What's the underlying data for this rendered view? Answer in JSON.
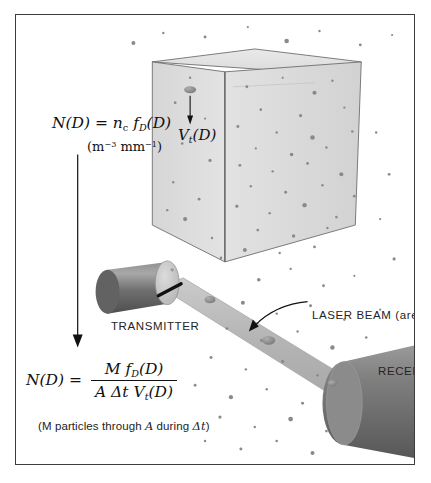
{
  "figure": {
    "border_color": "#3c3c3c",
    "background": "#ffffff"
  },
  "equations": {
    "top": {
      "lhs": "N(D)",
      "equals": "=",
      "rhs_coeff": "n",
      "rhs_coeff_sub": "c",
      "rhs_func": "f",
      "rhs_func_sub": "D",
      "rhs_arg": "(D)",
      "units_open": "(m",
      "units_exp1": "−3",
      "units_mid": " mm",
      "units_exp2": "−1",
      "units_close": ")"
    },
    "bottom": {
      "lhs": "N(D)",
      "equals": "=",
      "numerator_m": "M",
      "numerator_f": "f",
      "numerator_f_sub": "D",
      "numerator_arg": "(D)",
      "denominator_a": "A",
      "denominator_dt": "Δt",
      "denominator_v": "V",
      "denominator_v_sub": "t",
      "denominator_arg": "(D)",
      "note_pre": "(M particles through ",
      "note_a": "A",
      "note_mid": " during ",
      "note_dt": "Δt",
      "note_post": ")"
    }
  },
  "labels": {
    "transmitter": "TRANSMITTER",
    "laser_beam": "LASER BEAM (area A)",
    "receiver": "RECEIVER",
    "terminal_velocity": "V",
    "terminal_velocity_sub": "t",
    "terminal_velocity_arg": "(D)"
  },
  "colors": {
    "cube_fill": "#dedede",
    "cube_edge": "#6e6e6e",
    "beam_fill": "#b9b9b9",
    "instrument_dark": "#6d6d6d",
    "instrument_light": "#c9c9c9",
    "particle": "#8c8c8c",
    "arrow": "#111111",
    "text": "#1a1a1a"
  },
  "elements": {
    "sampling_volume_cube": "3D cube representing unit sampling volume filled with raindrops",
    "falling_drop_arrow": "downward arrow showing terminal fall velocity of a drop",
    "connector_arrow": "long vertical arrow linking the two expressions of N(D)",
    "laser_callout_arrow": "curved arrow from the LASER BEAM label to the beam sheet",
    "transmitter_unit": "cylindrical transmitter with slit aperture",
    "receiver_unit": "flared cylindrical receiver",
    "laser_sheet": "diagonal laser beam sheet between transmitter and receiver"
  }
}
